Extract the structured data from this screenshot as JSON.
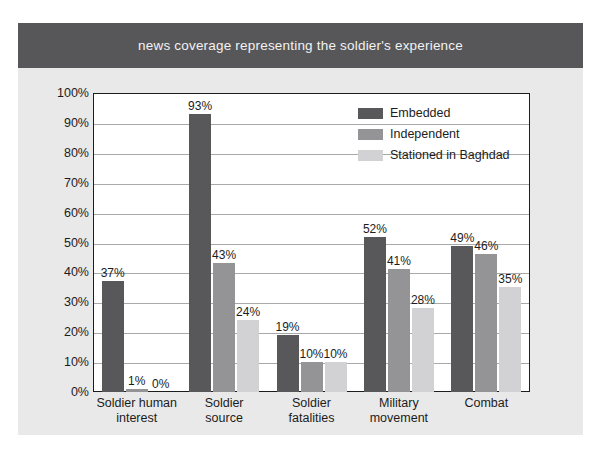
{
  "title": "news coverage representing the soldier's experience",
  "colors": {
    "banner": "#575759",
    "card_background": "#e9e9e9",
    "plot_background": "#ffffff",
    "frame": "#1d1d1d",
    "gridline": "#a9a9a9",
    "series_embedded": "#58585a",
    "series_independent": "#949496",
    "series_stationed": "#d2d2d4",
    "text": "#1c1c1c",
    "title_text": "#f2f2f2"
  },
  "legend": {
    "position": "inside-top-right",
    "items": [
      {
        "label": "Embedded",
        "color": "#58585a"
      },
      {
        "label": "Independent",
        "color": "#949496"
      },
      {
        "label": "Stationed in Baghdad",
        "color": "#d2d2d4"
      }
    ]
  },
  "axes": {
    "y_ticks": [
      "0%",
      "10%",
      "20%",
      "30%",
      "40%",
      "50%",
      "60%",
      "70%",
      "80%",
      "90%",
      "100%"
    ],
    "x_categories_lines": [
      [
        "Soldier human",
        "interest"
      ],
      [
        "Soldier",
        "source"
      ],
      [
        "Soldier",
        "fatalities"
      ],
      [
        "Military",
        "movement"
      ],
      [
        "Combat",
        ""
      ]
    ]
  },
  "chart_data": {
    "type": "bar",
    "title": "news coverage representing the soldier's experience",
    "xlabel": "",
    "ylabel": "",
    "ylim": [
      0,
      100
    ],
    "ytick_step": 10,
    "grid": true,
    "legend_position": "inside-top-right",
    "value_unit": "%",
    "categories": [
      "Soldier human interest",
      "Soldier source",
      "Soldier fatalities",
      "Military movement",
      "Combat"
    ],
    "series": [
      {
        "name": "Embedded",
        "color": "#58585a",
        "values": [
          37,
          93,
          19,
          52,
          49
        ],
        "labels": [
          "37%",
          "93%",
          "19%",
          "52%",
          "49%"
        ]
      },
      {
        "name": "Independent",
        "color": "#949496",
        "values": [
          1,
          43,
          10,
          41,
          46
        ],
        "labels": [
          "1%",
          "43%",
          "10%",
          "41%",
          "46%"
        ]
      },
      {
        "name": "Stationed in Baghdad",
        "color": "#d2d2d4",
        "values": [
          0,
          24,
          10,
          28,
          35
        ],
        "labels": [
          "0%",
          "24%",
          "10%",
          "28%",
          "35%"
        ]
      }
    ]
  }
}
